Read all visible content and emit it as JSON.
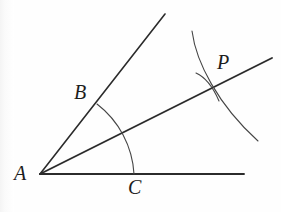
{
  "figure": {
    "kind": "geometry-diagram",
    "background_color": "#fefefe",
    "stroke_color": "#2b2b2b",
    "label_color": "#1d1d1d",
    "width": 281,
    "height": 212
  },
  "labels": {
    "vertex_a": "A",
    "point_b": "B",
    "point_c": "C",
    "point_p": "P"
  },
  "points": {
    "A": {
      "x": 40,
      "y": 174
    },
    "B_on_ray": {
      "x": 97,
      "y": 104
    },
    "C_on_ray": {
      "x": 134,
      "y": 174
    },
    "P": {
      "x": 215,
      "y": 85
    }
  },
  "rays": [
    {
      "name": "ray-AB",
      "from": {
        "x": 40,
        "y": 174
      },
      "to": {
        "x": 165,
        "y": 14
      },
      "stroke_width": 1.6
    },
    {
      "name": "ray-AP-bisector",
      "from": {
        "x": 40,
        "y": 174
      },
      "to": {
        "x": 272,
        "y": 58
      },
      "stroke_width": 1.9
    },
    {
      "name": "ray-AC",
      "from": {
        "x": 40,
        "y": 174
      },
      "to": {
        "x": 244,
        "y": 174
      },
      "stroke_width": 1.9
    }
  ],
  "arcs": [
    {
      "name": "angle-arc-from-vertex",
      "path": "M 97 104 A 95 95 0 0 1 134 174",
      "stroke_width": 1.1
    },
    {
      "name": "compass-arc-large",
      "path": "M 192 31 C 196 62 218 105 258 141",
      "stroke_width": 1.1
    },
    {
      "name": "compass-arc-small",
      "path": "M 196 73 C 205 77 213 87 219 101",
      "stroke_width": 1.1
    }
  ]
}
